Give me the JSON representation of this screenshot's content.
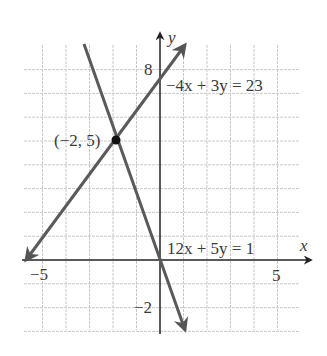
{
  "chart_data": {
    "type": "line",
    "title": "",
    "xlabel": "x",
    "ylabel": "y",
    "xlim": [
      -5.8,
      6.3
    ],
    "ylim": [
      -3,
      9.2
    ],
    "grid": true,
    "grid_x": [
      -5,
      -4,
      -3,
      -2,
      -1,
      1,
      2,
      3,
      4,
      5
    ],
    "grid_y": [
      -3,
      -2,
      -1,
      1,
      2,
      3,
      4,
      5,
      6,
      7,
      8
    ],
    "tick_labels": {
      "x": [
        {
          "value": -5,
          "label": "−5"
        },
        {
          "value": 5,
          "label": "5"
        }
      ],
      "y": [
        {
          "value": 8,
          "label": "8"
        },
        {
          "value": -2,
          "label": "−2"
        }
      ]
    },
    "series": [
      {
        "name": "−4x + 3y = 23",
        "equation": "−4x + 3y = 23",
        "points": [
          [
            -5.75,
            0
          ],
          [
            1.1,
            9.2
          ]
        ],
        "color": "#555555"
      },
      {
        "name": "12x + 5y = 1",
        "equation": "12x + 5y = 1",
        "points": [
          [
            -3.3,
            8.2
          ],
          [
            1.05,
            -2.9
          ]
        ],
        "color": "#555555"
      }
    ],
    "annotations": [
      {
        "type": "point",
        "x": -2,
        "y": 5,
        "label": "(−2, 5)"
      },
      {
        "type": "label",
        "text": "−4x + 3y = 23",
        "x": 0.2,
        "y": 7.1
      },
      {
        "type": "label",
        "text": "12x + 5y = 1",
        "x": 0.3,
        "y": 0.3
      }
    ]
  },
  "labels": {
    "x_axis": "x",
    "y_axis": "y",
    "tick_x_neg5": "−5",
    "tick_x_5": "5",
    "tick_y_8": "8",
    "tick_y_neg2": "−2",
    "point": "(−2, 5)",
    "eq1": "−4x + 3y = 23",
    "eq2": "12x + 5y = 1"
  }
}
